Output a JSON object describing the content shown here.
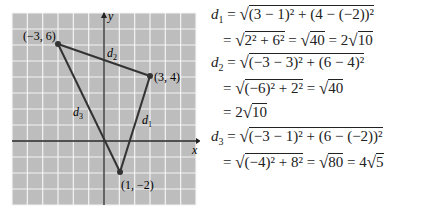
{
  "chart_data": {
    "type": "scatter",
    "title": "",
    "xlabel": "x",
    "ylabel": "y",
    "grid": true,
    "xlim": [
      -6,
      6
    ],
    "ylim": [
      -4,
      8
    ],
    "points": [
      {
        "x": -3,
        "y": 6,
        "label": "(−3, 6)"
      },
      {
        "x": 3,
        "y": 4,
        "label": "(3, 4)"
      },
      {
        "x": 1,
        "y": -2,
        "label": "(1, −2)"
      }
    ],
    "segments": [
      {
        "from": [
          3,
          4
        ],
        "to": [
          1,
          -2
        ],
        "label": "d1"
      },
      {
        "from": [
          -3,
          6
        ],
        "to": [
          3,
          4
        ],
        "label": "d2"
      },
      {
        "from": [
          -3,
          6
        ],
        "to": [
          1,
          -2
        ],
        "label": "d3"
      }
    ],
    "colors": {
      "grid_bg": "#bdbdbd",
      "grid_line": "#f2f2f2",
      "axis": "#222222",
      "line": "#333333"
    }
  },
  "graph": {
    "x_axis_label": "x",
    "y_axis_label": "y",
    "point_labels": [
      "(−3, 6)",
      "(3, 4)",
      "(1, −2)"
    ],
    "segment_labels": {
      "d1": "d",
      "d2": "d",
      "d3": "d",
      "s1": "1",
      "s2": "2",
      "s3": "3"
    }
  },
  "equations": {
    "d1_name": "d",
    "d1_sub": "1",
    "d2_name": "d",
    "d2_sub": "2",
    "d3_name": "d",
    "d3_sub": "3",
    "line1": "(3 − 1)² + (4 − (−2))²",
    "line2a": "2² + 6²",
    "line2b": "40",
    "line2c": "2",
    "line2d": "10",
    "line3": "(−3 − 3)² + (6 − 4)²",
    "line4a": "(−6)² + 2²",
    "line4b": "40",
    "line5a": "2",
    "line5b": "10",
    "line6": "(−3 − 1)² + (6 − (−2))²",
    "line7a": "(−4)² + 8²",
    "line7b": "80",
    "line7c": "4",
    "line7d": "5"
  }
}
